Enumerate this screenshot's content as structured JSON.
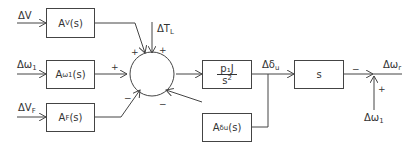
{
  "diagram": {
    "type": "block-diagram",
    "inputs": {
      "dV": {
        "base": "ΔV",
        "sub": ""
      },
      "dw1": {
        "base": "Δω",
        "sub": "1"
      },
      "dVF": {
        "base": "ΔV",
        "sub": "F"
      },
      "dTL": {
        "base": "ΔT",
        "sub": "L"
      },
      "dw1_bottom": {
        "base": "Δω",
        "sub": "1"
      }
    },
    "blocks": {
      "Av": {
        "base": "A",
        "sub": "V",
        "tail": " (s)"
      },
      "Aw1": {
        "base": "A",
        "sub": "ω1",
        "tail": "(s)"
      },
      "AF": {
        "base": "A",
        "sub": "F",
        "tail": " (s)"
      },
      "Adu": {
        "base": "A",
        "sub": "δu",
        "tail": "(s)"
      },
      "plant": {
        "num": "p₁J",
        "den_base": "s",
        "den_sup": "2"
      },
      "deriv": {
        "label": "s"
      }
    },
    "signals": {
      "ddu": {
        "base": "Δδ",
        "sub": "u"
      },
      "dwr": {
        "base": "Δω",
        "sub": "r"
      }
    },
    "signs": {
      "sum_top_left": "+",
      "sum_top_right": "+",
      "sum_left": "+",
      "sum_bottom_left": "−",
      "sum_bottom_right": "−",
      "out_minus": "−",
      "out_plus": "+"
    }
  }
}
